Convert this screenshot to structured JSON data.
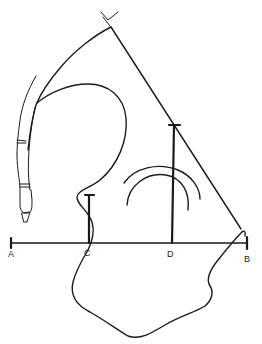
{
  "diagram": {
    "type": "anatomical-tracing",
    "colors": {
      "ink": "#1a1a1a",
      "background": "#ffffff"
    },
    "points": {
      "A": {
        "label": "A",
        "x": 11,
        "y": 243
      },
      "B": {
        "label": "B",
        "x": 247,
        "y": 243
      },
      "C": {
        "label": "C",
        "x": 89,
        "y": 243
      },
      "D": {
        "label": "D",
        "x": 172,
        "y": 243
      }
    },
    "segments": [
      {
        "name": "baseline-AB",
        "from": "A",
        "to": "B"
      },
      {
        "name": "vertical-at-C",
        "from": "C",
        "top_y": 195
      },
      {
        "name": "vertical-at-D",
        "from": "D",
        "top_y": 125
      },
      {
        "name": "diagonal-line",
        "from_xy": [
          111,
          27
        ],
        "to_xy": [
          241,
          229
        ]
      }
    ],
    "labels": {
      "A": "A",
      "B": "B",
      "C": "C",
      "D": "D"
    }
  }
}
